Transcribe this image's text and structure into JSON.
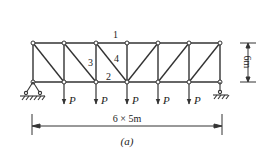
{
  "figure": {
    "caption": "(a)",
    "span_label": "6 × 5m",
    "height_label": "6m",
    "member_labels": [
      "1",
      "2",
      "3",
      "4"
    ],
    "load_label": "P",
    "panels": 6,
    "panel_length": "5m",
    "height": "6m",
    "supports": [
      {
        "position": "left",
        "type": "pinned"
      },
      {
        "position": "right",
        "type": "roller"
      }
    ],
    "loads": [
      {
        "node": 1,
        "label": "P"
      },
      {
        "node": 2,
        "label": "P"
      },
      {
        "node": 3,
        "label": "P"
      },
      {
        "node": 4,
        "label": "P"
      },
      {
        "node": 5,
        "label": "P"
      }
    ],
    "colors": {
      "line": "#333333",
      "background": "#ffffff"
    }
  }
}
